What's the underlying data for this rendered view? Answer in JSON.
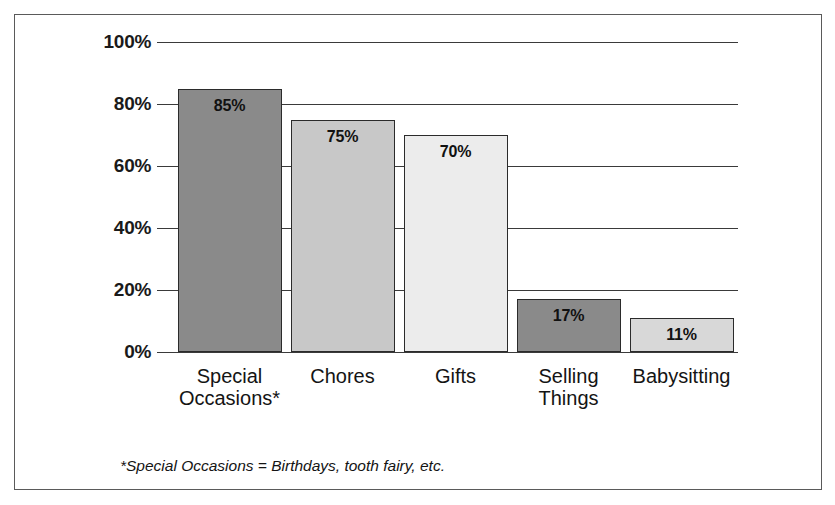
{
  "chart_data": {
    "type": "bar",
    "title": "",
    "subtitle": "",
    "xlabel": "",
    "ylabel": "",
    "categories": [
      "Special\nOccasions*",
      "Chores",
      "Gifts",
      "Selling\nThings",
      "Babysitting"
    ],
    "values": [
      85,
      75,
      70,
      17,
      11
    ],
    "value_labels": [
      "85%",
      "75%",
      "70%",
      "17%",
      "11%"
    ],
    "bar_colors": [
      "#8a8a8a",
      "#c8c8c8",
      "#ececec",
      "#8a8a8a",
      "#d8d8d8"
    ],
    "bar_border_color": "#2b2b2b",
    "ylim": [
      0,
      100
    ],
    "ytick_values": [
      100,
      80,
      60,
      40,
      20,
      0
    ],
    "ytick_labels": [
      "100%",
      "80%",
      "60%",
      "40%",
      "20%",
      "0%"
    ],
    "grid": true,
    "grid_orientation": "horizontal",
    "grid_color": "#3a3a3a",
    "legend": null,
    "legend_position": "none",
    "annotations": [
      "*Special Occasions = Birthdays, tooth fairy, etc."
    ]
  },
  "footnote": "*Special Occasions = Birthdays, tooth fairy, etc.",
  "frame": {
    "border_color": "#5a5a5a",
    "background": "#ffffff"
  }
}
